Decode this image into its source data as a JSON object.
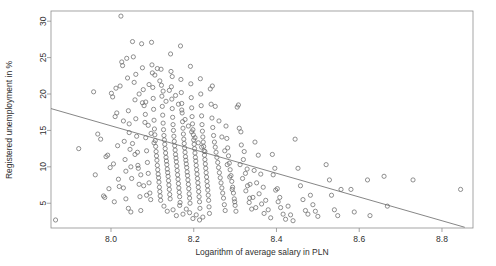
{
  "chart_data": {
    "type": "scatter",
    "title": "",
    "subtitle": "",
    "xlabel": "Logarithm of average salary in PLN",
    "ylabel": "Registered unemployment in %",
    "xlim": [
      7.855,
      8.875
    ],
    "ylim": [
      1.6,
      31.4
    ],
    "xticks": [
      8.0,
      8.2,
      8.4,
      8.6,
      8.8
    ],
    "xticklabels": [
      "8.0",
      "8.2",
      "8.4",
      "8.6",
      "8.8"
    ],
    "yticks": [
      5,
      10,
      15,
      20,
      25,
      30
    ],
    "yticklabels": [
      "5",
      "10",
      "15",
      "20",
      "25",
      "30"
    ],
    "grid": false,
    "legend": null,
    "marker": "open-circle",
    "marker_color": "#6b6b6b",
    "frame_color": "#8e8e8e",
    "background": "#ffffff",
    "annotations": [],
    "trendline": {
      "type": "linear-fit",
      "color": "#707070",
      "x_start": 7.855,
      "y_start": 18.0,
      "x_end": 8.855,
      "y_end": 1.7
    },
    "n_points": 330,
    "points": [
      [
        7.866,
        2.7
      ],
      [
        7.922,
        12.5
      ],
      [
        7.958,
        20.3
      ],
      [
        7.962,
        8.9
      ],
      [
        7.968,
        14.5
      ],
      [
        7.975,
        13.8
      ],
      [
        7.982,
        6.0
      ],
      [
        7.985,
        5.8
      ],
      [
        7.988,
        11.4
      ],
      [
        7.992,
        11.6
      ],
      [
        7.995,
        7.0
      ],
      [
        7.998,
        9.9
      ],
      [
        8.001,
        20.1
      ],
      [
        8.004,
        19.6
      ],
      [
        8.006,
        10.4
      ],
      [
        8.008,
        5.2
      ],
      [
        8.01,
        16.9
      ],
      [
        8.012,
        20.8
      ],
      [
        8.014,
        17.4
      ],
      [
        8.016,
        12.9
      ],
      [
        8.018,
        8.3
      ],
      [
        8.02,
        7.3
      ],
      [
        8.022,
        21.1
      ],
      [
        8.024,
        30.7
      ],
      [
        8.026,
        24.4
      ],
      [
        8.028,
        23.9
      ],
      [
        8.03,
        16.3
      ],
      [
        8.032,
        13.5
      ],
      [
        8.034,
        11.0
      ],
      [
        8.036,
        9.4
      ],
      [
        8.038,
        24.9
      ],
      [
        8.04,
        22.2
      ],
      [
        8.042,
        17.7
      ],
      [
        8.044,
        14.7
      ],
      [
        8.046,
        12.4
      ],
      [
        8.048,
        10.0
      ],
      [
        8.05,
        8.4
      ],
      [
        8.052,
        27.2
      ],
      [
        8.054,
        25.1
      ],
      [
        8.056,
        21.6
      ],
      [
        8.058,
        19.2
      ],
      [
        8.06,
        16.6
      ],
      [
        8.062,
        14.2
      ],
      [
        8.064,
        12.0
      ],
      [
        8.066,
        9.8
      ],
      [
        8.068,
        7.6
      ],
      [
        8.07,
        5.9
      ],
      [
        8.072,
        4.0
      ],
      [
        8.074,
        26.9
      ],
      [
        8.076,
        23.6
      ],
      [
        8.078,
        20.6
      ],
      [
        8.08,
        18.4
      ],
      [
        8.082,
        16.1
      ],
      [
        8.084,
        14.0
      ],
      [
        8.086,
        12.2
      ],
      [
        8.088,
        10.6
      ],
      [
        8.09,
        9.1
      ],
      [
        8.092,
        7.8
      ],
      [
        8.094,
        6.4
      ],
      [
        8.096,
        5.5
      ],
      [
        8.098,
        27.1
      ],
      [
        8.1,
        22.9
      ],
      [
        8.101,
        20.9
      ],
      [
        8.102,
        19.4
      ],
      [
        8.103,
        17.9
      ],
      [
        8.104,
        16.4
      ],
      [
        8.105,
        15.2
      ],
      [
        8.106,
        14.4
      ],
      [
        8.107,
        13.6
      ],
      [
        8.108,
        12.8
      ],
      [
        8.109,
        12.1
      ],
      [
        8.11,
        11.5
      ],
      [
        8.111,
        10.9
      ],
      [
        8.112,
        10.2
      ],
      [
        8.113,
        9.6
      ],
      [
        8.114,
        9.0
      ],
      [
        8.115,
        8.5
      ],
      [
        8.116,
        7.9
      ],
      [
        8.117,
        7.2
      ],
      [
        8.118,
        6.6
      ],
      [
        8.119,
        6.0
      ],
      [
        8.12,
        5.4
      ],
      [
        8.121,
        23.4
      ],
      [
        8.122,
        21.2
      ],
      [
        8.123,
        19.7
      ],
      [
        8.124,
        18.3
      ],
      [
        8.125,
        17.1
      ],
      [
        8.126,
        16.0
      ],
      [
        8.127,
        15.1
      ],
      [
        8.128,
        14.3
      ],
      [
        8.129,
        13.7
      ],
      [
        8.13,
        13.1
      ],
      [
        8.131,
        12.5
      ],
      [
        8.132,
        11.9
      ],
      [
        8.133,
        11.3
      ],
      [
        8.134,
        10.8
      ],
      [
        8.135,
        10.3
      ],
      [
        8.136,
        9.7
      ],
      [
        8.137,
        9.2
      ],
      [
        8.138,
        8.7
      ],
      [
        8.139,
        8.1
      ],
      [
        8.14,
        7.5
      ],
      [
        8.141,
        6.9
      ],
      [
        8.142,
        6.2
      ],
      [
        8.143,
        5.6
      ],
      [
        8.144,
        25.5
      ],
      [
        8.145,
        23.1
      ],
      [
        8.146,
        21.0
      ],
      [
        8.147,
        19.3
      ],
      [
        8.148,
        18.0
      ],
      [
        8.149,
        16.8
      ],
      [
        8.15,
        15.8
      ],
      [
        8.151,
        15.0
      ],
      [
        8.152,
        14.2
      ],
      [
        8.153,
        13.5
      ],
      [
        8.154,
        12.9
      ],
      [
        8.155,
        12.3
      ],
      [
        8.156,
        11.7
      ],
      [
        8.157,
        11.2
      ],
      [
        8.158,
        10.7
      ],
      [
        8.159,
        10.1
      ],
      [
        8.16,
        9.5
      ],
      [
        8.161,
        8.9
      ],
      [
        8.162,
        8.3
      ],
      [
        8.163,
        7.7
      ],
      [
        8.164,
        7.1
      ],
      [
        8.165,
        6.5
      ],
      [
        8.166,
        5.9
      ],
      [
        8.167,
        5.1
      ],
      [
        8.168,
        26.6
      ],
      [
        8.169,
        22.0
      ],
      [
        8.17,
        20.2
      ],
      [
        8.171,
        18.7
      ],
      [
        8.172,
        17.4
      ],
      [
        8.173,
        16.2
      ],
      [
        8.174,
        15.3
      ],
      [
        8.175,
        14.5
      ],
      [
        8.176,
        13.8
      ],
      [
        8.177,
        13.2
      ],
      [
        8.178,
        12.6
      ],
      [
        8.179,
        12.0
      ],
      [
        8.18,
        11.4
      ],
      [
        8.181,
        10.9
      ],
      [
        8.182,
        10.4
      ],
      [
        8.183,
        9.9
      ],
      [
        8.184,
        9.3
      ],
      [
        8.185,
        8.8
      ],
      [
        8.186,
        8.2
      ],
      [
        8.187,
        7.6
      ],
      [
        8.188,
        7.0
      ],
      [
        8.189,
        6.3
      ],
      [
        8.19,
        5.7
      ],
      [
        8.191,
        5.0
      ],
      [
        8.192,
        23.8
      ],
      [
        8.193,
        21.4
      ],
      [
        8.194,
        19.5
      ],
      [
        8.195,
        18.1
      ],
      [
        8.196,
        16.9
      ],
      [
        8.197,
        15.9
      ],
      [
        8.198,
        15.1
      ],
      [
        8.199,
        14.4
      ],
      [
        8.2,
        13.7
      ],
      [
        8.201,
        13.1
      ],
      [
        8.202,
        12.5
      ],
      [
        8.203,
        11.9
      ],
      [
        8.204,
        11.3
      ],
      [
        8.205,
        10.8
      ],
      [
        8.206,
        10.2
      ],
      [
        8.207,
        9.6
      ],
      [
        8.208,
        9.0
      ],
      [
        8.209,
        8.4
      ],
      [
        8.21,
        7.8
      ],
      [
        8.211,
        7.2
      ],
      [
        8.212,
        6.6
      ],
      [
        8.213,
        5.9
      ],
      [
        8.214,
        5.2
      ],
      [
        8.215,
        4.3
      ],
      [
        8.216,
        22.1
      ],
      [
        8.217,
        20.0
      ],
      [
        8.218,
        18.4
      ],
      [
        8.219,
        17.0
      ],
      [
        8.22,
        15.8
      ],
      [
        8.221,
        14.9
      ],
      [
        8.222,
        14.1
      ],
      [
        8.223,
        13.4
      ],
      [
        8.224,
        12.8
      ],
      [
        8.225,
        12.2
      ],
      [
        8.226,
        11.6
      ],
      [
        8.227,
        11.0
      ],
      [
        8.228,
        10.4
      ],
      [
        8.229,
        9.8
      ],
      [
        8.23,
        9.2
      ],
      [
        8.231,
        8.6
      ],
      [
        8.232,
        8.0
      ],
      [
        8.233,
        7.4
      ],
      [
        8.234,
        6.8
      ],
      [
        8.235,
        6.1
      ],
      [
        8.236,
        5.4
      ],
      [
        8.237,
        4.5
      ],
      [
        8.238,
        3.6
      ],
      [
        8.24,
        20.7
      ],
      [
        8.242,
        18.6
      ],
      [
        8.244,
        16.7
      ],
      [
        8.246,
        15.4
      ],
      [
        8.248,
        14.3
      ],
      [
        8.25,
        13.4
      ],
      [
        8.252,
        12.7
      ],
      [
        8.254,
        12.0
      ],
      [
        8.256,
        11.3
      ],
      [
        8.258,
        10.6
      ],
      [
        8.26,
        9.9
      ],
      [
        8.262,
        9.2
      ],
      [
        8.264,
        8.5
      ],
      [
        8.266,
        7.8
      ],
      [
        8.268,
        7.1
      ],
      [
        8.27,
        6.4
      ],
      [
        8.272,
        5.7
      ],
      [
        8.274,
        4.8
      ],
      [
        8.276,
        4.0
      ],
      [
        8.278,
        15.6
      ],
      [
        8.28,
        13.9
      ],
      [
        8.282,
        12.6
      ],
      [
        8.284,
        11.5
      ],
      [
        8.286,
        10.5
      ],
      [
        8.288,
        9.6
      ],
      [
        8.29,
        8.8
      ],
      [
        8.292,
        8.0
      ],
      [
        8.294,
        7.2
      ],
      [
        8.296,
        6.4
      ],
      [
        8.298,
        5.6
      ],
      [
        8.3,
        4.7
      ],
      [
        8.302,
        3.9
      ],
      [
        8.245,
        21.1
      ],
      [
        8.252,
        18.3
      ],
      [
        8.261,
        16.3
      ],
      [
        8.268,
        14.1
      ],
      [
        8.275,
        12.2
      ],
      [
        8.281,
        10.3
      ],
      [
        8.287,
        8.6
      ],
      [
        8.293,
        6.9
      ],
      [
        8.299,
        5.2
      ],
      [
        8.305,
        18.2
      ],
      [
        8.31,
        15.3
      ],
      [
        8.315,
        13.0
      ],
      [
        8.32,
        11.0
      ],
      [
        8.325,
        9.1
      ],
      [
        8.33,
        7.4
      ],
      [
        8.335,
        5.7
      ],
      [
        8.34,
        4.2
      ],
      [
        8.308,
        18.5
      ],
      [
        8.314,
        14.8
      ],
      [
        8.322,
        12.1
      ],
      [
        8.329,
        9.7
      ],
      [
        8.336,
        7.6
      ],
      [
        8.343,
        5.8
      ],
      [
        8.35,
        4.4
      ],
      [
        8.312,
        10.3
      ],
      [
        8.318,
        8.4
      ],
      [
        8.326,
        6.7
      ],
      [
        8.334,
        5.1
      ],
      [
        8.346,
        9.5
      ],
      [
        8.352,
        7.8
      ],
      [
        8.358,
        6.3
      ],
      [
        8.364,
        4.9
      ],
      [
        8.37,
        3.6
      ],
      [
        8.348,
        13.4
      ],
      [
        8.356,
        11.6
      ],
      [
        8.362,
        9.0
      ],
      [
        8.368,
        7.2
      ],
      [
        8.374,
        5.4
      ],
      [
        8.38,
        4.1
      ],
      [
        8.386,
        3.0
      ],
      [
        8.392,
        8.9
      ],
      [
        8.398,
        6.8
      ],
      [
        8.404,
        5.2
      ],
      [
        8.41,
        4.4
      ],
      [
        8.416,
        3.5
      ],
      [
        8.422,
        2.8
      ],
      [
        8.39,
        11.7
      ],
      [
        8.396,
        9.8
      ],
      [
        8.402,
        7.0
      ],
      [
        8.408,
        5.8
      ],
      [
        8.428,
        4.6
      ],
      [
        8.434,
        3.4
      ],
      [
        8.44,
        2.6
      ],
      [
        8.445,
        13.8
      ],
      [
        8.452,
        9.8
      ],
      [
        8.458,
        7.4
      ],
      [
        8.464,
        5.5
      ],
      [
        8.47,
        4.0
      ],
      [
        8.476,
        3.5
      ],
      [
        8.482,
        6.1
      ],
      [
        8.488,
        4.8
      ],
      [
        8.494,
        3.9
      ],
      [
        8.5,
        3.2
      ],
      [
        8.52,
        10.3
      ],
      [
        8.528,
        8.2
      ],
      [
        8.533,
        6.1
      ],
      [
        8.54,
        4.1
      ],
      [
        8.548,
        3.3
      ],
      [
        8.556,
        6.9
      ],
      [
        8.58,
        6.9
      ],
      [
        8.588,
        3.8
      ],
      [
        8.62,
        8.2
      ],
      [
        8.626,
        3.3
      ],
      [
        8.66,
        8.7
      ],
      [
        8.668,
        4.6
      ],
      [
        8.73,
        8.2
      ],
      [
        8.845,
        6.9
      ],
      [
        8.084,
        18.9
      ],
      [
        8.092,
        21.3
      ],
      [
        8.099,
        24.0
      ],
      [
        8.106,
        22.6
      ],
      [
        8.112,
        23.5
      ],
      [
        8.118,
        21.8
      ],
      [
        8.126,
        20.4
      ],
      [
        8.133,
        19.0
      ],
      [
        8.141,
        20.5
      ],
      [
        8.148,
        22.4
      ],
      [
        8.156,
        19.8
      ],
      [
        8.163,
        18.6
      ],
      [
        8.171,
        17.8
      ],
      [
        8.179,
        16.5
      ],
      [
        8.187,
        15.6
      ],
      [
        8.195,
        14.8
      ],
      [
        8.203,
        14.0
      ],
      [
        8.211,
        13.3
      ],
      [
        8.219,
        12.7
      ],
      [
        8.227,
        12.1
      ],
      [
        8.06,
        22.7
      ],
      [
        8.068,
        20.0
      ],
      [
        8.076,
        18.8
      ],
      [
        8.083,
        17.2
      ],
      [
        8.09,
        15.7
      ],
      [
        8.097,
        14.6
      ],
      [
        8.104,
        13.3
      ],
      [
        8.044,
        15.9
      ],
      [
        8.052,
        13.2
      ],
      [
        8.058,
        11.7
      ],
      [
        8.065,
        10.2
      ],
      [
        8.072,
        8.9
      ],
      [
        8.079,
        7.4
      ],
      [
        8.086,
        6.1
      ],
      [
        8.03,
        7.1
      ],
      [
        8.036,
        5.6
      ],
      [
        8.042,
        4.3
      ],
      [
        8.048,
        3.8
      ],
      [
        8.128,
        4.6
      ],
      [
        8.136,
        3.9
      ],
      [
        8.15,
        4.1
      ],
      [
        8.158,
        3.3
      ],
      [
        8.166,
        4.7
      ],
      [
        8.174,
        3.5
      ],
      [
        8.182,
        4.2
      ],
      [
        8.19,
        3.7
      ],
      [
        8.198,
        2.9
      ],
      [
        8.206,
        3.4
      ],
      [
        8.214,
        2.7
      ],
      [
        8.222,
        3.1
      ]
    ]
  },
  "axes": {
    "x_axis_title": "Logarithm of average salary in PLN",
    "y_axis_title": "Registered unemployment in %"
  }
}
